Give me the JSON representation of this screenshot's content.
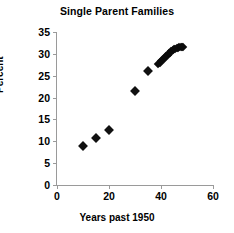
{
  "chart_data": {
    "type": "scatter",
    "title": "Single Parent Families",
    "xlabel": "Years past 1950",
    "ylabel": "Percent",
    "xlim": [
      0,
      60
    ],
    "ylim": [
      0,
      35
    ],
    "xticks": [
      0,
      20,
      40,
      60
    ],
    "yticks": [
      0,
      5,
      10,
      15,
      20,
      25,
      30,
      35
    ],
    "xtick_labels": [
      "0",
      "20",
      "40",
      "60"
    ],
    "ytick_labels": [
      "0",
      "5",
      "10",
      "15",
      "20",
      "25",
      "30",
      "35"
    ],
    "grid": false,
    "legend": false,
    "marker": "diamond",
    "marker_color": "#111111",
    "series": [
      {
        "name": "Single parent families",
        "points": [
          [
            10,
            8.9
          ],
          [
            15,
            10.8
          ],
          [
            20,
            12.6
          ],
          [
            30,
            21.4
          ],
          [
            35,
            26.1
          ],
          [
            39,
            27.7
          ],
          [
            39.5,
            28.0
          ],
          [
            40,
            28.3
          ],
          [
            40.5,
            28.6
          ],
          [
            41,
            28.9
          ],
          [
            41.5,
            29.2
          ],
          [
            42,
            29.5
          ],
          [
            42.5,
            29.8
          ],
          [
            43,
            30.1
          ],
          [
            43.5,
            30.3
          ],
          [
            44,
            30.6
          ],
          [
            44.5,
            30.8
          ],
          [
            45,
            31.0
          ],
          [
            45.5,
            31.2
          ],
          [
            46,
            31.3
          ],
          [
            46.5,
            31.4
          ],
          [
            47,
            31.5
          ],
          [
            47.5,
            31.5
          ],
          [
            48,
            31.6
          ],
          [
            48.5,
            31.5
          ]
        ]
      }
    ]
  }
}
